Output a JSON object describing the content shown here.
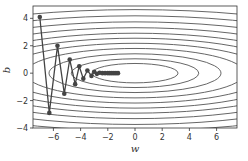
{
  "chart_data": {
    "type": "line",
    "title": "",
    "xlabel": "w",
    "ylabel": "b",
    "xlim": [
      -7.5,
      7.5
    ],
    "ylim": [
      -4,
      4.9
    ],
    "x_ticks": [
      -6,
      -4,
      -2,
      0,
      2,
      4,
      6
    ],
    "y_ticks": [
      -4,
      -2,
      0,
      2,
      4
    ],
    "x_tick_labels": [
      "−6",
      "−4",
      "−2",
      "0",
      "2",
      "4",
      "6"
    ],
    "y_tick_labels": [
      "−4",
      "−2",
      "0",
      "2",
      "4"
    ],
    "grid": false,
    "legend": null,
    "contour": {
      "function": "0.1*w^2 + 2*b^2",
      "levels": [
        1,
        2.2,
        4,
        6.5,
        9.5,
        13,
        17,
        22,
        28,
        35,
        43
      ],
      "color": "#555555"
    },
    "series": [
      {
        "name": "gradient descent trajectory",
        "color": "#444444",
        "marker": "o",
        "points": [
          [
            -7.0,
            4.1
          ],
          [
            -6.3,
            -2.9
          ],
          [
            -5.7,
            2.0
          ],
          [
            -5.2,
            -1.5
          ],
          [
            -4.8,
            1.0
          ],
          [
            -4.4,
            -0.8
          ],
          [
            -4.1,
            0.5
          ],
          [
            -3.8,
            -0.4
          ],
          [
            -3.5,
            0.2
          ],
          [
            -3.2,
            -0.2
          ],
          [
            -3.0,
            0.1
          ],
          [
            -2.8,
            -0.05
          ],
          [
            -2.6,
            0.03
          ],
          [
            -2.4,
            0.0
          ],
          [
            -2.2,
            0.0
          ],
          [
            -2.0,
            0.0
          ],
          [
            -1.85,
            0.0
          ],
          [
            -1.7,
            0.0
          ],
          [
            -1.55,
            0.0
          ],
          [
            -1.4,
            0.0
          ],
          [
            -1.25,
            0.0
          ]
        ]
      }
    ]
  }
}
